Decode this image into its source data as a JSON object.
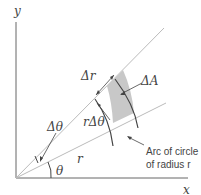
{
  "diagram": {
    "axes": {
      "x_label": "x",
      "y_label": "y"
    },
    "labels": {
      "delta_r": "Δr",
      "delta_A": "ΔA",
      "r_delta_theta": "rΔθ",
      "delta_theta": "Δθ",
      "r": "r",
      "theta": "θ",
      "arc_line1": "Arc of circle",
      "arc_line2": "of radius r"
    },
    "colors": {
      "axis": "#555555",
      "ray": "#bbbbbb",
      "arc": "#444444",
      "shaded_region": "#c8c8c8",
      "text": "#444444"
    }
  }
}
